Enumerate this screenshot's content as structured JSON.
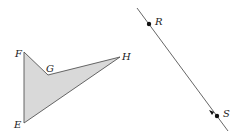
{
  "diagram": {
    "polygon": {
      "fill": "#d9d9d9",
      "stroke": "#555555",
      "vertices": [
        {
          "label": "F",
          "x": 24,
          "y": 52
        },
        {
          "label": "G",
          "x": 48,
          "y": 75
        },
        {
          "label": "H",
          "x": 120,
          "y": 57
        },
        {
          "label": "E",
          "x": 24,
          "y": 123
        }
      ],
      "labels": {
        "F": "F",
        "G": "G",
        "H": "H",
        "E": "E"
      }
    },
    "line": {
      "stroke": "#555555",
      "from": {
        "x": 137,
        "y": 8
      },
      "to": {
        "x": 228,
        "y": 131
      },
      "points": {
        "R": "R",
        "S": "S"
      }
    }
  }
}
